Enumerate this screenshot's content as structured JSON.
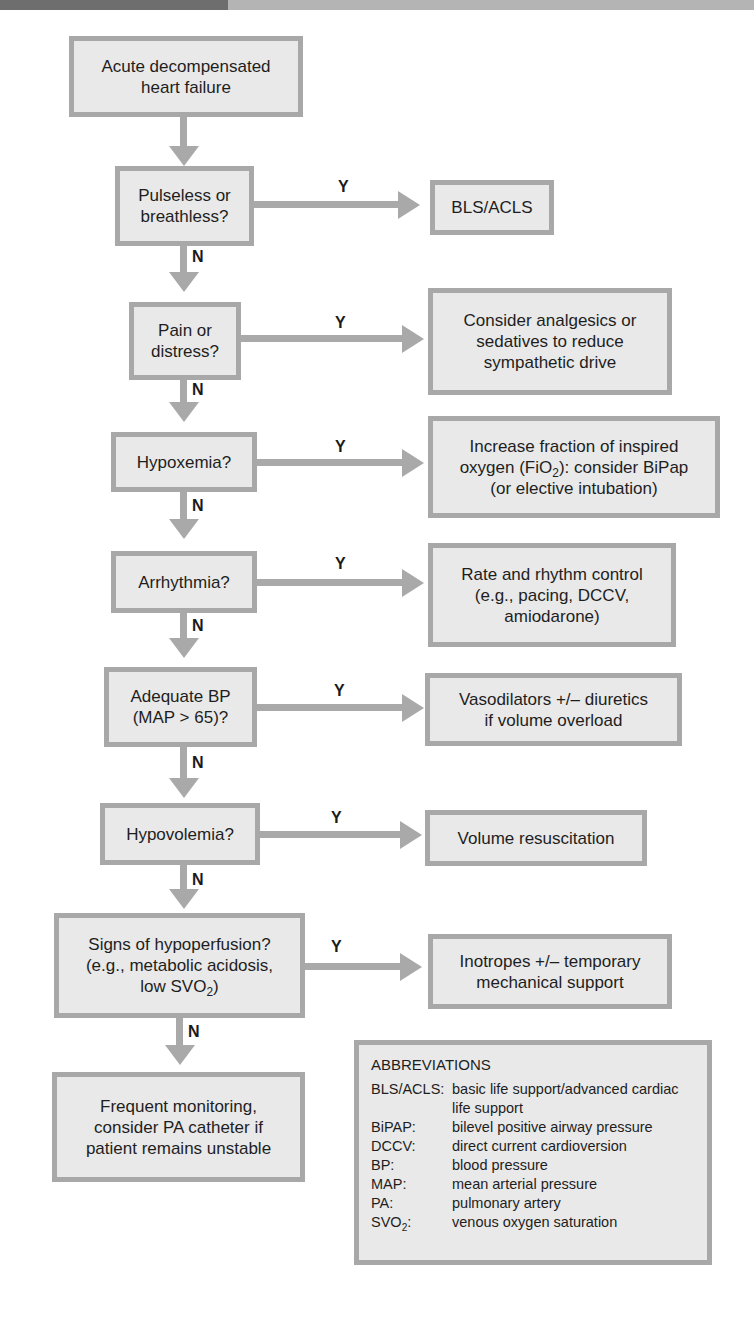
{
  "header": {
    "title_fragment": "p                        e Failure"
  },
  "colors": {
    "box_fill": "#e9e9e9",
    "box_border": "#a8a8a8",
    "connector": "#a9a9a9",
    "text": "#1e1e1e"
  },
  "labels": {
    "yes": "Y",
    "no": "N"
  },
  "flow": {
    "start": {
      "text": "Acute decompensated\nheart failure"
    },
    "decisions": [
      {
        "question": "Pulseless or\nbreathless?",
        "yes_action": "BLS/ACLS"
      },
      {
        "question": "Pain or\ndistress?",
        "yes_action": "Consider analgesics or\nsedatives to reduce\nsympathetic drive"
      },
      {
        "question": "Hypoxemia?",
        "yes_action_pre": "Increase fraction of inspired\noxygen (FiO",
        "yes_action_sub": "2",
        "yes_action_post": "): consider BiPap\n(or elective intubation)"
      },
      {
        "question": "Arrhythmia?",
        "yes_action": "Rate and rhythm control\n(e.g., pacing, DCCV,\namiodarone)"
      },
      {
        "question": "Adequate BP\n(MAP > 65)?",
        "yes_action": "Vasodilators +/– diuretics\nif volume overload"
      },
      {
        "question": "Hypovolemia?",
        "yes_action": "Volume resuscitation"
      },
      {
        "question_pre": "Signs of hypoperfusion?\n(e.g., metabolic acidosis,\nlow SVO",
        "question_sub": "2",
        "question_post": ")",
        "yes_action": "Inotropes +/– temporary\nmechanical support"
      }
    ],
    "end": {
      "text": "Frequent monitoring,\nconsider PA catheter if\npatient remains unstable"
    }
  },
  "abbreviations": {
    "heading": "ABBREVIATIONS",
    "items": [
      {
        "term": "BLS/ACLS:",
        "definition": "basic life support/advanced cardiac life support"
      },
      {
        "term": "BiPAP:",
        "definition": "bilevel positive airway pressure"
      },
      {
        "term": "DCCV:",
        "definition": "direct current cardioversion"
      },
      {
        "term": "BP:",
        "definition": "blood pressure"
      },
      {
        "term": "MAP:",
        "definition": "mean arterial pressure"
      },
      {
        "term": "PA:",
        "definition": "pulmonary artery"
      },
      {
        "term_pre": "SVO",
        "term_sub": "2",
        "term_post": ":",
        "definition": "venous oxygen saturation"
      }
    ]
  }
}
